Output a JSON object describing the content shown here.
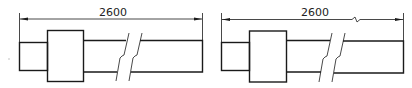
{
  "figures": [
    {
      "id": "left",
      "dimension_label": "2600",
      "dimension_line_break": false,
      "shaft_break": true
    },
    {
      "id": "right",
      "dimension_label": "2600",
      "dimension_line_break": true,
      "shaft_break": true
    }
  ],
  "colors": {
    "line": "#1a1a1a",
    "background": "#ffffff"
  }
}
